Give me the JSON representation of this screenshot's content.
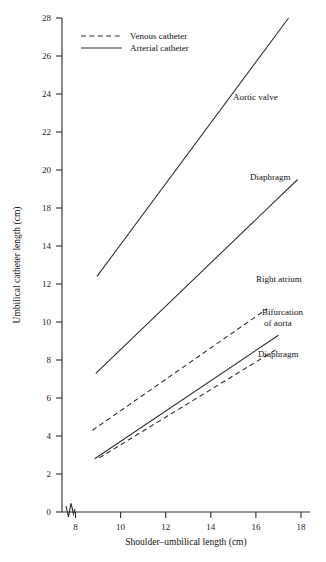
{
  "chart_data": {
    "type": "line",
    "title": "",
    "xlabel": "Shoulder–umbilical length (cm)",
    "ylabel": "Umbilical catheter length (cm)",
    "xlim": [
      7.4,
      18.4
    ],
    "ylim": [
      0,
      28
    ],
    "xticks": [
      8,
      10,
      12,
      14,
      16,
      18
    ],
    "yticks": [
      0,
      2,
      4,
      6,
      8,
      10,
      12,
      14,
      18,
      20,
      22,
      24,
      26,
      28
    ],
    "ytick_labels": [
      "0",
      "2",
      "4",
      "6",
      "8",
      "10",
      "12",
      "14",
      "18",
      "20",
      "22",
      "24",
      "26",
      "28"
    ],
    "grid": false,
    "axis_break": true,
    "legend": {
      "position": "top-left-inside",
      "entries": [
        {
          "label": "Venous catheter",
          "style": "dashed"
        },
        {
          "label": "Arterial catheter",
          "style": "solid"
        }
      ]
    },
    "series": [
      {
        "name": "Aortic valve",
        "catheter": "Arterial catheter",
        "style": "solid",
        "annotation": "Aortic valve",
        "x": [
          8.95,
          17.45
        ],
        "y": [
          12.4,
          28.0
        ]
      },
      {
        "name": "Diaphragm (arterial)",
        "catheter": "Arterial catheter",
        "style": "solid",
        "annotation": "Diaphragm",
        "x": [
          8.9,
          17.85
        ],
        "y": [
          7.3,
          19.5
        ]
      },
      {
        "name": "Right atrium",
        "catheter": "Venous catheter",
        "style": "dashed",
        "annotation": "Right atrium",
        "x": [
          8.75,
          16.5
        ],
        "y": [
          4.3,
          10.7
        ]
      },
      {
        "name": "Diaphragm (venous)",
        "catheter": "Venous catheter",
        "style": "solid",
        "annotation": "Diaphragm",
        "x": [
          8.85,
          17.0
        ],
        "y": [
          2.8,
          9.3
        ]
      },
      {
        "name": "Bifurcation of aorta",
        "catheter": "Venous catheter",
        "style": "dashed",
        "annotation": "Bifurcation of aorta",
        "x": [
          9.05,
          16.9
        ],
        "y": [
          2.85,
          8.55
        ]
      }
    ],
    "annotations": [
      {
        "text": "Aortic valve",
        "x": 233,
        "y": 100
      },
      {
        "text": "Diaphragm",
        "x": 250,
        "y": 180
      },
      {
        "text": "Right atrium",
        "x": 256,
        "y": 282
      },
      {
        "text": "Bifurcation",
        "x": 262,
        "y": 315
      },
      {
        "text": "of aorta",
        "x": 264,
        "y": 326
      },
      {
        "text": "Diaphragm",
        "x": 258,
        "y": 357
      }
    ]
  },
  "colors": {
    "line": "#2b2b2b",
    "text": "#111111",
    "background": "#ffffff"
  }
}
